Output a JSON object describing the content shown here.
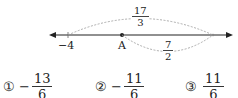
{
  "diagram": {
    "number_line": {
      "left_label": "−4",
      "point_label": "A",
      "top_arc_label": {
        "numerator": "17",
        "denominator": "3"
      },
      "bottom_arc_label": {
        "numerator": "7",
        "denominator": "2"
      }
    }
  },
  "options": [
    {
      "marker": "①",
      "sign": "−",
      "numerator": "13",
      "denominator": "6"
    },
    {
      "marker": "②",
      "sign": "−",
      "numerator": "11",
      "denominator": "6"
    },
    {
      "marker": "③",
      "sign": "",
      "numerator": "11",
      "denominator": "6"
    }
  ]
}
